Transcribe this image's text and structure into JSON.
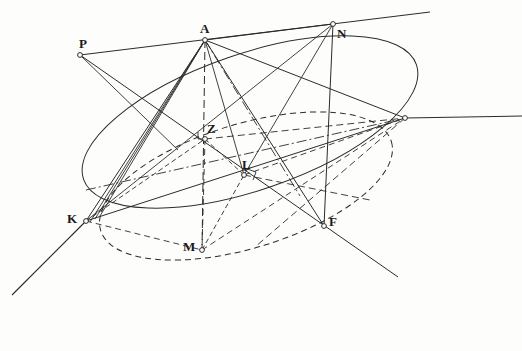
{
  "figure": {
    "kind": "geometric-construction-diagram",
    "width": 522,
    "height": 351,
    "background_color": "#fdfdfc",
    "ink_color": "#2b2b2b"
  },
  "points": [
    {
      "id": "A",
      "label": "A",
      "x": 205,
      "y": 40,
      "label_dx": -5,
      "label_dy": -18,
      "marker": "open-circle"
    },
    {
      "id": "N",
      "label": "N",
      "x": 333,
      "y": 24,
      "label_dx": 4,
      "label_dy": 3,
      "marker": "open-circle"
    },
    {
      "id": "P",
      "label": "P",
      "x": 80,
      "y": 55,
      "label_dx": -1,
      "label_dy": -18,
      "marker": "open-circle"
    },
    {
      "id": "K",
      "label": "K",
      "x": 86,
      "y": 221,
      "label_dx": -19,
      "label_dy": -9,
      "marker": "open-circle"
    },
    {
      "id": "Z",
      "label": "Z",
      "x": 205,
      "y": 139,
      "label_dx": 2,
      "label_dy": -17,
      "marker": "open-circle"
    },
    {
      "id": "L",
      "label": "L",
      "x": 244,
      "y": 175,
      "label_dx": -2,
      "label_dy": -17,
      "marker": "open-circle"
    },
    {
      "id": "M",
      "label": "M",
      "x": 202,
      "y": 250,
      "label_dx": -19,
      "label_dy": -10,
      "marker": "open-circle"
    },
    {
      "id": "F",
      "label": "F",
      "x": 324,
      "y": 226,
      "label_dx": 5,
      "label_dy": -11,
      "marker": "open-circle"
    },
    {
      "id": "V",
      "label": "",
      "x": 405,
      "y": 118,
      "label_dx": 0,
      "label_dy": 0,
      "marker": "open-circle"
    }
  ],
  "curves": {
    "main_ellipse": {
      "name": "main-ellipse",
      "style": "solid",
      "cx": 250,
      "cy": 122,
      "rx": 176,
      "ry": 68,
      "rotation": -19
    },
    "inner_ellipse": {
      "name": "inner-dashed-ellipse",
      "style": "dashed",
      "cx": 246,
      "cy": 186,
      "rx": 152,
      "ry": 62,
      "rotation": -17
    }
  },
  "annotations": {
    "right_angle_marks": [
      {
        "at": "Z",
        "x": 205,
        "y": 139
      },
      {
        "at": "L",
        "x": 244,
        "y": 175
      }
    ]
  },
  "line_styles": {
    "solid": "solid",
    "dashed": "dashed",
    "dashdot": "dash-dot"
  }
}
